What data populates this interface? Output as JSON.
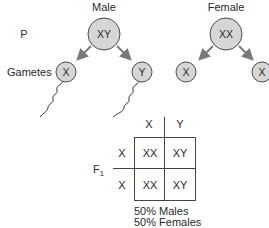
{
  "parents": {
    "generation_label": "P",
    "male": {
      "label": "Male",
      "genotype": "XY"
    },
    "female": {
      "label": "Female",
      "genotype": "XX"
    }
  },
  "gametes": {
    "label": "Gametes",
    "male": [
      "X",
      "Y"
    ],
    "female": [
      "X",
      "X"
    ]
  },
  "punnett": {
    "generation_label": "F",
    "generation_subscript": "1",
    "column_headers": [
      "X",
      "Y"
    ],
    "row_headers": [
      "X",
      "X"
    ],
    "cells": [
      [
        "XX",
        "XY"
      ],
      [
        "XX",
        "XY"
      ]
    ]
  },
  "result": {
    "line1": "50% Males",
    "line2": "50% Females"
  },
  "colors": {
    "circle_fill": "#d6d6d6",
    "arrow": "#7a7a7a",
    "text": "#2a2a2a"
  }
}
